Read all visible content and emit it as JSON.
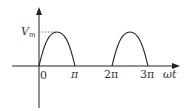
{
  "diagram": {
    "y_axis": {
      "label_main": "V",
      "label_sub": "m"
    },
    "x_axis": {
      "label": "ωt"
    },
    "origin_label": "0",
    "ticks": [
      "π",
      "2π",
      "3π"
    ],
    "colors": {
      "axis": "#222222",
      "curve": "#222222",
      "text": "#333333",
      "dotted": "#555555"
    },
    "curve": {
      "type": "half-wave rectified sine",
      "humps": [
        {
          "start": "0",
          "end": "π",
          "peak": "Vm"
        },
        {
          "start": "2π",
          "end": "3π",
          "peak": "Vm"
        }
      ]
    }
  }
}
